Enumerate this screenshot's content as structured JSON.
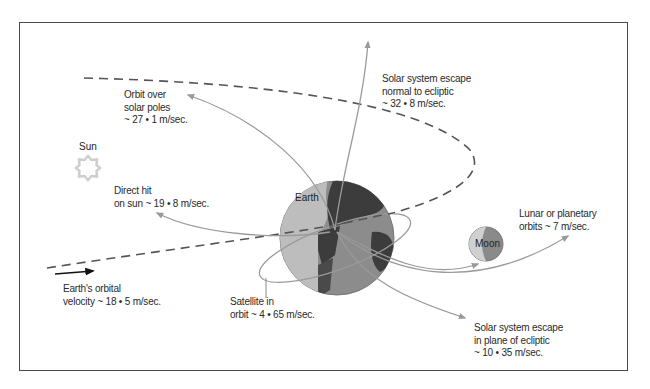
{
  "diagram": {
    "title": "",
    "colors": {
      "frame": "#4a4a4a",
      "trajectory": "#9a9a9a",
      "orbit_dashed": "#555555",
      "earth_ocean": "#8c8c8c",
      "earth_land": "#3c3c3c",
      "earth_light": "#bdbdbd",
      "sun": "#d2d2d2",
      "moon_light": "#cfcfcf",
      "moon_dark": "#8a8a8a"
    },
    "bodies": {
      "sun": "Sun",
      "earth": "Earth",
      "moon": "Moon"
    },
    "labels": {
      "solar_poles": [
        "Orbit over",
        "solar poles",
        "~ 27 • 1 m/sec."
      ],
      "escape_normal": [
        "Solar system escape",
        "normal to ecliptic",
        "~ 32 • 8 m/sec."
      ],
      "direct_hit": [
        "Direct hit",
        "on sun ~ 19 • 8 m/sec."
      ],
      "lunar": [
        "Lunar or planetary",
        "orbits ~ 7 m/sec."
      ],
      "orbital_velocity": [
        "Earth's orbital",
        "velocity ~ 18 • 5 m/sec."
      ],
      "satellite": [
        "Satellite in",
        "orbit ~ 4 • 65 m/sec."
      ],
      "escape_plane": [
        "Solar system escape",
        "in plane of ecliptic",
        "~ 10 • 35 m/sec."
      ]
    }
  }
}
